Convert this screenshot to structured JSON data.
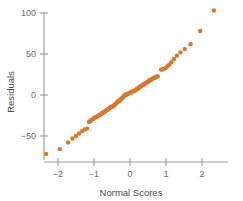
{
  "chart_data": {
    "type": "scatter",
    "title": "",
    "xlabel": "Normal Scores",
    "ylabel": "Residuals",
    "xlim": [
      -2.6,
      2.75
    ],
    "ylim": [
      -82,
      115
    ],
    "xticks": [
      -2,
      -1,
      0,
      1,
      2
    ],
    "xticklabels": [
      "−2",
      "−1",
      "0",
      "1",
      "2"
    ],
    "yticks": [
      -50,
      0,
      50,
      100
    ],
    "yticklabels": [
      "−50",
      "0",
      "50",
      "100"
    ],
    "grid": false,
    "legend": null,
    "marker": {
      "shape": "circle",
      "color": "#D9772F",
      "size": 2.2
    },
    "axis_color": "#9a9a9a",
    "series": [
      {
        "name": "Residuals vs Normal Scores",
        "x": [
          -2.33,
          -1.95,
          -1.72,
          -1.6,
          -1.5,
          -1.41,
          -1.33,
          -1.26,
          -1.19,
          -1.14,
          -1.11,
          -1.08,
          -1.05,
          -1.02,
          -0.99,
          -0.96,
          -0.93,
          -0.9,
          -0.87,
          -0.85,
          -0.82,
          -0.79,
          -0.77,
          -0.74,
          -0.72,
          -0.69,
          -0.67,
          -0.64,
          -0.62,
          -0.59,
          -0.57,
          -0.55,
          -0.52,
          -0.5,
          -0.48,
          -0.45,
          -0.43,
          -0.41,
          -0.38,
          -0.36,
          -0.34,
          -0.32,
          -0.29,
          -0.27,
          -0.25,
          -0.23,
          -0.2,
          -0.18,
          -0.16,
          -0.14,
          -0.12,
          -0.09,
          -0.07,
          -0.05,
          -0.03,
          0.0,
          0.03,
          0.05,
          0.07,
          0.09,
          0.12,
          0.14,
          0.16,
          0.18,
          0.2,
          0.23,
          0.25,
          0.27,
          0.29,
          0.32,
          0.34,
          0.36,
          0.38,
          0.41,
          0.43,
          0.45,
          0.48,
          0.5,
          0.52,
          0.55,
          0.57,
          0.59,
          0.62,
          0.64,
          0.67,
          0.69,
          0.72,
          0.74,
          0.77,
          0.86,
          0.9,
          0.94,
          0.99,
          1.04,
          1.09,
          1.15,
          1.22,
          1.3,
          1.4,
          1.52,
          1.68,
          1.95,
          2.33
        ],
        "y": [
          -72,
          -66,
          -58,
          -53,
          -50,
          -47,
          -44,
          -42,
          -41,
          -33,
          -32,
          -31,
          -30,
          -29,
          -28,
          -27,
          -27,
          -26,
          -25,
          -24,
          -24,
          -23,
          -22,
          -21,
          -21,
          -20,
          -19,
          -18,
          -18,
          -17,
          -16,
          -15,
          -15,
          -14,
          -14,
          -13,
          -12,
          -11,
          -10,
          -9,
          -8,
          -8,
          -7,
          -6,
          -5,
          -4,
          -3,
          -2,
          -1,
          0,
          0,
          1,
          1,
          2,
          2,
          3,
          3,
          4,
          4,
          5,
          5,
          6,
          6,
          7,
          8,
          8,
          9,
          10,
          10,
          11,
          12,
          12,
          13,
          14,
          14,
          15,
          16,
          16,
          17,
          18,
          18,
          19,
          20,
          20,
          21,
          21,
          22,
          22,
          23,
          31,
          31,
          32,
          33,
          35,
          37,
          40,
          44,
          48,
          52,
          56,
          62,
          78,
          103
        ]
      }
    ]
  }
}
